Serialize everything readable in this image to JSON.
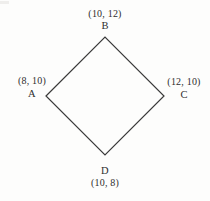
{
  "figure": {
    "name": "quadrilateral-diagram",
    "background_color": "#fdfdfc",
    "stroke_color": "#3a3a3a",
    "stroke_width": 1.2
  },
  "chart_data": {
    "type": "scatter",
    "title": "",
    "xlabel": "",
    "ylabel": "",
    "shape": "rhombus",
    "closed": true,
    "vertex_order": [
      "A",
      "B",
      "C",
      "D"
    ],
    "points": [
      {
        "name": "A",
        "x": 8,
        "y": 10,
        "label": "(8, 10)",
        "position": "left",
        "pixel_x": 46,
        "pixel_y": 96
      },
      {
        "name": "B",
        "x": 10,
        "y": 12,
        "label": "(10, 12)",
        "position": "top",
        "pixel_x": 105,
        "pixel_y": 37
      },
      {
        "name": "C",
        "x": 12,
        "y": 10,
        "label": "(12, 10)",
        "position": "right",
        "pixel_x": 164,
        "pixel_y": 96
      },
      {
        "name": "D",
        "x": 10,
        "y": 8,
        "label": "(10, 8)",
        "position": "bottom",
        "pixel_x": 105,
        "pixel_y": 155
      }
    ],
    "edges": [
      {
        "from": "A",
        "to": "B"
      },
      {
        "from": "B",
        "to": "C"
      },
      {
        "from": "C",
        "to": "D"
      },
      {
        "from": "D",
        "to": "A"
      }
    ],
    "polygon_path": "M 46 96 L 105 37 L 164 96 L 105 155 Z",
    "grid": false,
    "legend": false,
    "axes_shown": false
  },
  "labels": {
    "a": {
      "letter": "A",
      "coord": "(8, 10)"
    },
    "b": {
      "letter": "B",
      "coord": "(10, 12)"
    },
    "c": {
      "letter": "C",
      "coord": "(12, 10)"
    },
    "d": {
      "letter": "D",
      "coord": "(10, 8)"
    }
  }
}
